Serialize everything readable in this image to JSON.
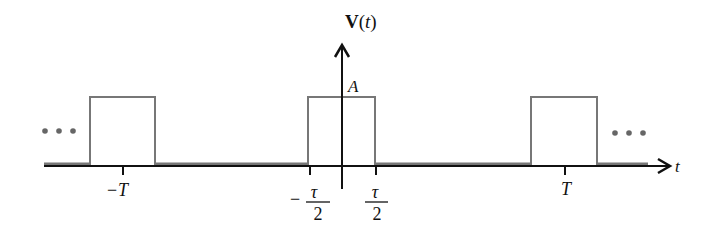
{
  "diagram": {
    "y_axis_label_bold": "V",
    "y_axis_label_rest": "(t)",
    "y_axis_label_t": "t",
    "x_axis_label": "t",
    "amplitude_label": "A",
    "ellipsis_left": "• • •",
    "ellipsis_right": "• • •",
    "ticks": {
      "minus_T": {
        "sign": "−",
        "symbol": "T"
      },
      "minus_tau_half": {
        "sign": "−",
        "numerator": "τ",
        "denominator": "2"
      },
      "tau_half": {
        "numerator": "τ",
        "denominator": "2"
      },
      "T": {
        "symbol": "T"
      }
    },
    "colors": {
      "axis": "#111111",
      "pulse": "#777777",
      "baseline_shade": "#777777",
      "dots": "#666666"
    }
  }
}
